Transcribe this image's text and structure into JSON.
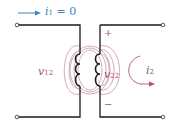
{
  "diagram": {
    "type": "transformer-circuit",
    "current_label": {
      "symbol": "i",
      "sub": "1",
      "rest": " = 0"
    },
    "v12_label": {
      "symbol": "v",
      "sub": "12"
    },
    "v22_label": {
      "symbol": "v",
      "sub": "22"
    },
    "i2_label": {
      "symbol": "i",
      "sub": "2"
    },
    "plus_sign": "+",
    "minus_sign": "−",
    "colors": {
      "wire": "#1a1a1a",
      "coil": "#1a1a1a",
      "flux": "#b0677f",
      "label": "#b0506a",
      "arrow": "#3a86c4",
      "text_blue": "#3a86c4"
    }
  }
}
